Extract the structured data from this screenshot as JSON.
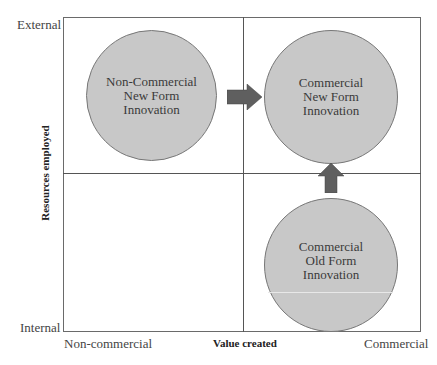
{
  "diagram": {
    "type": "2x2 matrix",
    "y_axis": {
      "title": "Resources employed",
      "top_label": "External",
      "bottom_label": "Internal"
    },
    "x_axis": {
      "title": "Value created",
      "left_label": "Non-commercial",
      "right_label": "Commercial"
    },
    "quadrants": [
      {
        "position": "top-left",
        "label": "Non-Commercial\nNew Form\nInnovation"
      },
      {
        "position": "top-right",
        "label": "Commercial\nNew Form\nInnovation"
      },
      {
        "position": "bottom-left",
        "label": ""
      },
      {
        "position": "bottom-right",
        "label": "Commercial\nOld Form\nInnovation"
      }
    ],
    "arrows": [
      {
        "from": "Non-Commercial New Form Innovation",
        "to": "Commercial New Form Innovation",
        "direction": "right"
      },
      {
        "from": "Commercial Old Form Innovation",
        "to": "Commercial New Form Innovation",
        "direction": "up"
      }
    ],
    "colors": {
      "circle_fill": "#c8c8c8",
      "arrow_fill": "#5f5f5f",
      "grid_line": "#555555"
    }
  }
}
